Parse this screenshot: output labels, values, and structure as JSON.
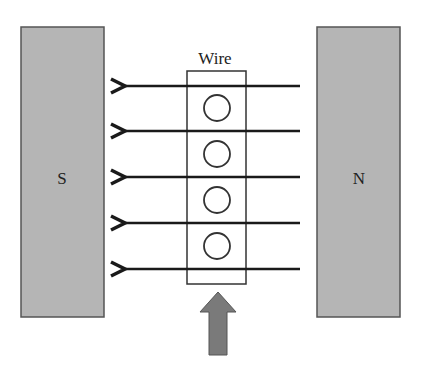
{
  "diagram": {
    "magnets": [
      {
        "label": "S",
        "x": 21,
        "y": 27,
        "w": 83,
        "h": 290
      },
      {
        "label": "N",
        "x": 317,
        "y": 27,
        "w": 83,
        "h": 290
      }
    ],
    "wire": {
      "label": "Wire",
      "x": 187,
      "y": 71,
      "w": 59,
      "h": 213
    },
    "field_lines": {
      "direction": "right-to-left (N to S)",
      "y": [
        86,
        131,
        177,
        223,
        269
      ],
      "x_start": 300,
      "x_tip": 122
    },
    "current_symbols": {
      "type": "circle (out of page)",
      "cx": 217,
      "cy": [
        108,
        154,
        200,
        246
      ],
      "r": 13
    },
    "force_arrow": {
      "direction": "up",
      "tip_y": 292,
      "bottom_y": 355,
      "cx": 218
    },
    "colors": {
      "magnet_fill": "#b5b5b5",
      "magnet_stroke": "#555555",
      "line": "#1a1a1a",
      "arrow_fill": "#7a7a7a"
    }
  }
}
